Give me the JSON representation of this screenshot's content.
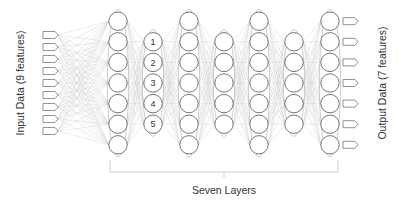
{
  "diagram": {
    "input_label": "Input Data (9 features)",
    "output_label": "Output Data (7 features)",
    "bracket_label": "Seven Layers",
    "input_count": 9,
    "output_count": 7,
    "layers": [
      {
        "x": 118,
        "nodes": 7,
        "labels": []
      },
      {
        "x": 153,
        "nodes": 5,
        "labels": [
          "1",
          "2",
          "3",
          "4",
          "5"
        ]
      },
      {
        "x": 189,
        "nodes": 7,
        "labels": []
      },
      {
        "x": 224,
        "nodes": 5,
        "labels": []
      },
      {
        "x": 259,
        "nodes": 7,
        "labels": []
      },
      {
        "x": 294,
        "nodes": 5,
        "labels": []
      },
      {
        "x": 330,
        "nodes": 7,
        "labels": []
      }
    ]
  }
}
